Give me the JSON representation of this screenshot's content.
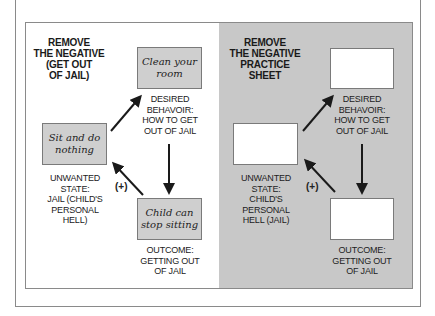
{
  "left_panel": {
    "title_lines": [
      "REMOVE",
      "THE NEGATIVE",
      "(GET OUT",
      "OF JAIL)"
    ],
    "boxes": {
      "desired": {
        "lines": [
          "Clean your",
          "room"
        ]
      },
      "unwanted": {
        "lines": [
          "Sit and do",
          "nothing"
        ]
      },
      "outcome": {
        "lines": [
          "Child can",
          "stop sitting"
        ]
      }
    },
    "labels": {
      "desired": [
        "DESIRED",
        "BEHAVOIR:",
        "HOW TO GET",
        "OUT OF JAIL"
      ],
      "unwanted": [
        "UNWANTED",
        "STATE:",
        "JAIL (CHILD'S",
        "PERSONAL",
        "HELL)"
      ],
      "outcome": [
        "OUTCOME:",
        "GETTING OUT",
        "OF JAIL"
      ]
    },
    "plus_label": "(+)"
  },
  "right_panel": {
    "title_lines": [
      "REMOVE",
      "THE NEGATIVE",
      "PRACTICE",
      "SHEET"
    ],
    "labels": {
      "desired": [
        "DESIRED",
        "BEHAVOIR:",
        "HOW TO GET",
        "OUT OF JAIL"
      ],
      "unwanted": [
        "UNWANTED",
        "STATE:",
        "CHILD'S",
        "PERSONAL",
        "HELL (JAIL)"
      ],
      "outcome": [
        "OUTCOME:",
        "GETTING OUT",
        "OF JAIL"
      ]
    },
    "plus_label": "(+)"
  },
  "colors": {
    "box_fill": "#cfcfcf",
    "panel_gray": "#c8c8c8",
    "border": "#8a8a8a",
    "arrow": "#1a1a1a"
  }
}
